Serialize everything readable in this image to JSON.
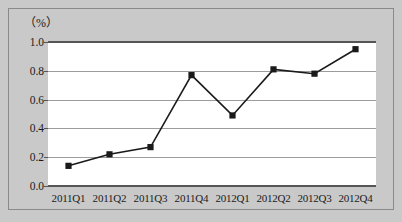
{
  "chart_data": {
    "type": "line",
    "title": "",
    "subtitle": "",
    "xlabel": "",
    "ylabel": "（%）",
    "unit_label": "（%）",
    "categories": [
      "2011Q1",
      "2011Q2",
      "2011Q3",
      "2011Q4",
      "2012Q1",
      "2012Q2",
      "2012Q3",
      "2012Q4"
    ],
    "values": [
      0.14,
      0.22,
      0.27,
      0.77,
      0.49,
      0.81,
      0.78,
      0.95
    ],
    "series": [
      {
        "name": "",
        "values": [
          0.14,
          0.22,
          0.27,
          0.77,
          0.49,
          0.81,
          0.78,
          0.95
        ],
        "color": "#1a1a1a",
        "marker": "square"
      }
    ],
    "ylim": [
      0.0,
      1.0
    ],
    "ytick_labels": [
      "0.0",
      "0.2",
      "0.4",
      "0.6",
      "0.8",
      "1.0"
    ],
    "ytick_values": [
      0.0,
      0.2,
      0.4,
      0.6,
      0.8,
      1.0
    ],
    "grid": true,
    "grid_axis": "y",
    "legend": false,
    "legend_position": "none",
    "plot_background": "#ffffff",
    "figure_background": "#c9c9c9",
    "line_color": "#1a1a1a",
    "marker_color": "#1a1a1a",
    "grid_color": "#9c9c9c",
    "axis_color": "#555555",
    "border_color": "#8a8a8a"
  }
}
